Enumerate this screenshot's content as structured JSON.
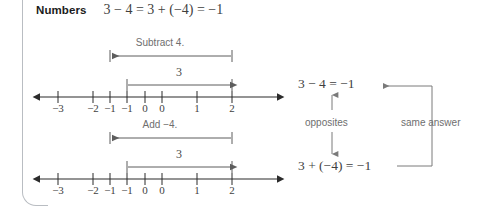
{
  "callout": {
    "label": "Numbers",
    "equation": "3 − 4 = 3 + (−4) = −1"
  },
  "number_lines": [
    {
      "id": "subtract",
      "operation_label": "Subtract 4.",
      "span_label": "3",
      "ticks": [
        "−3",
        "−2",
        "−1",
        "0",
        "1",
        "2",
        "3",
        "4"
      ],
      "tick_values": [
        -3,
        -2,
        -1,
        0,
        1,
        2,
        3,
        4
      ],
      "axis_min": -3,
      "axis_max": 4,
      "left_arrow": true,
      "right_arrow": true,
      "operation_arrow": {
        "from": 3,
        "to": -1,
        "direction": "left"
      },
      "span_arrow": {
        "from": 0,
        "to": 3,
        "direction": "right"
      }
    },
    {
      "id": "add-negative",
      "operation_label": "Add −4.",
      "span_label": "3",
      "ticks": [
        "−3",
        "−2",
        "−1",
        "0",
        "1",
        "2",
        "3",
        "4"
      ],
      "tick_values": [
        -3,
        -2,
        -1,
        0,
        1,
        2,
        3,
        4
      ],
      "axis_min": -3,
      "axis_max": 4,
      "left_arrow": true,
      "right_arrow": true,
      "operation_arrow": {
        "from": 3,
        "to": -1,
        "direction": "left"
      },
      "span_arrow": {
        "from": 0,
        "to": 3,
        "direction": "right"
      }
    }
  ],
  "right_panel": {
    "equation_top": "3 − 4 = −1",
    "equation_bottom": "3 + (−4) = −1",
    "label_opposites": "opposites",
    "label_same_answer": "same answer"
  },
  "colors": {
    "text": "#3f3f3f",
    "heading": "#1b1b1b",
    "label_grey": "#6e6e6e",
    "rule": "#b9bdc2",
    "axis": "#2b2b2b",
    "arrow_grey": "#7a7a7a",
    "background": "#ffffff"
  }
}
